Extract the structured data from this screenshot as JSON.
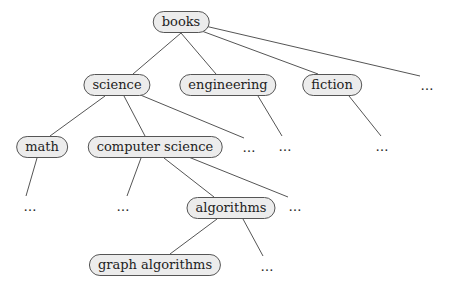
{
  "diagram": {
    "type": "tree",
    "nodes": [
      {
        "id": "books",
        "label": "books",
        "x": 181,
        "y": 22
      },
      {
        "id": "science",
        "label": "science",
        "x": 117,
        "y": 85
      },
      {
        "id": "engineering",
        "label": "engineering",
        "x": 228,
        "y": 85
      },
      {
        "id": "fiction",
        "label": "fiction",
        "x": 332,
        "y": 85
      },
      {
        "id": "math",
        "label": "math",
        "x": 42,
        "y": 147
      },
      {
        "id": "computer_science",
        "label": "computer science",
        "x": 155,
        "y": 147
      },
      {
        "id": "algorithms",
        "label": "algorithms",
        "x": 231,
        "y": 208
      },
      {
        "id": "graph_algorithms",
        "label": "graph algorithms",
        "x": 155,
        "y": 265
      }
    ],
    "ellipses": [
      {
        "id": "books_more",
        "label": "…",
        "x": 428,
        "y": 85
      },
      {
        "id": "science_more",
        "label": "…",
        "x": 250,
        "y": 147
      },
      {
        "id": "engineering_child",
        "label": "…",
        "x": 286,
        "y": 146
      },
      {
        "id": "fiction_child",
        "label": "…",
        "x": 383,
        "y": 146
      },
      {
        "id": "math_child",
        "label": "…",
        "x": 31,
        "y": 206
      },
      {
        "id": "cs_child",
        "label": "…",
        "x": 124,
        "y": 206
      },
      {
        "id": "cs_more",
        "label": "…",
        "x": 296,
        "y": 206
      },
      {
        "id": "algorithms_more",
        "label": "…",
        "x": 268,
        "y": 266
      }
    ],
    "edges": [
      [
        181,
        33,
        133,
        74
      ],
      [
        181,
        33,
        216,
        74
      ],
      [
        199,
        30,
        318,
        74
      ],
      [
        205,
        26,
        420,
        76
      ],
      [
        105,
        96,
        50,
        136
      ],
      [
        124,
        96,
        145,
        136
      ],
      [
        138,
        94,
        244,
        138
      ],
      [
        258,
        96,
        282,
        136
      ],
      [
        349,
        96,
        381,
        136
      ],
      [
        37,
        158,
        26,
        196
      ],
      [
        141,
        158,
        127,
        196
      ],
      [
        164,
        158,
        214,
        197
      ],
      [
        186,
        156,
        288,
        197
      ],
      [
        217,
        219,
        170,
        254
      ],
      [
        243,
        219,
        263,
        256
      ]
    ]
  }
}
